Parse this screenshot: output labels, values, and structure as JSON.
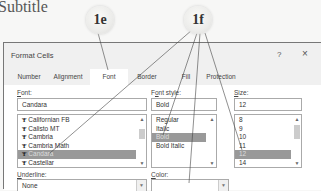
{
  "page": {
    "subtitle": "Subtitle"
  },
  "callouts": [
    {
      "id": "1e",
      "label": "1e"
    },
    {
      "id": "1f",
      "label": "1f"
    }
  ],
  "dialog": {
    "title": "Format Cells",
    "help_label": "?",
    "close_label": "×",
    "tabs": [
      {
        "label": "Number",
        "active": false
      },
      {
        "label": "Alignment",
        "active": false
      },
      {
        "label": "Font",
        "active": true
      },
      {
        "label": "Border",
        "active": false
      },
      {
        "label": "Fill",
        "active": false
      },
      {
        "label": "Protection",
        "active": false
      }
    ],
    "font": {
      "label_accel": "F",
      "label_rest": "ont:",
      "value": "Candara",
      "icon": "truetype-font-icon",
      "options": [
        "Californian FB",
        "Calisto MT",
        "Cambria",
        "Cambria Math",
        "Candara",
        "Castellar"
      ],
      "selected": "Candara"
    },
    "font_style": {
      "label_accel": "o",
      "label_pre": "F",
      "label_rest": "nt style:",
      "value": "Bold",
      "options": [
        "Regular",
        "Italic",
        "Bold",
        "Bold Italic"
      ],
      "selected": "Bold"
    },
    "size": {
      "label_accel": "S",
      "label_rest": "ize:",
      "value": "12",
      "options": [
        "8",
        "9",
        "10",
        "11",
        "12",
        "14"
      ],
      "selected": "12"
    },
    "underline": {
      "label_accel": "U",
      "label_rest": "nderline:",
      "value": "None"
    },
    "color": {
      "label_accel": "C",
      "label_rest": "olor:",
      "value": ""
    }
  },
  "colors": {
    "selection": "#999999",
    "dialog_bg": "#f0f0f0",
    "panel_bg": "#ffffff",
    "border": "#aaaaaa"
  }
}
